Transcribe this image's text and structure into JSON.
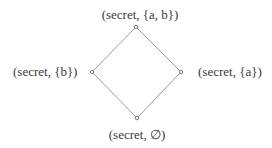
{
  "diagram": {
    "type": "lattice",
    "nodes": [
      {
        "id": "top",
        "label": "(secret, {a, b})",
        "x": 136,
        "y": 27
      },
      {
        "id": "left",
        "label": "(secret, {b})",
        "x": 92,
        "y": 72
      },
      {
        "id": "right",
        "label": "(secret, {a})",
        "x": 181,
        "y": 72
      },
      {
        "id": "bottom",
        "label": "(secret, ∅)",
        "x": 137,
        "y": 118
      }
    ],
    "edges": [
      {
        "from": "top",
        "to": "left"
      },
      {
        "from": "top",
        "to": "right"
      },
      {
        "from": "left",
        "to": "bottom"
      },
      {
        "from": "right",
        "to": "bottom"
      }
    ],
    "colors": {
      "edge": "#9a9a9a",
      "node_stroke": "#7a7a7a",
      "text": "#3a3a3a"
    }
  }
}
